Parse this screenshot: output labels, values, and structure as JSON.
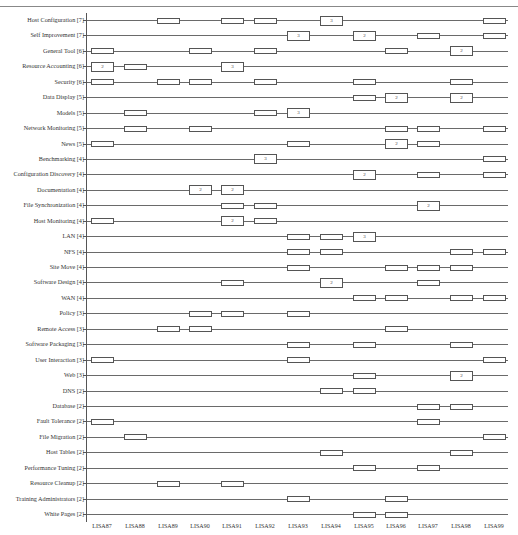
{
  "chart_data": {
    "type": "timeline-presence",
    "title": "",
    "xlabel": "",
    "ylabel": "",
    "categories": [
      "LISA87",
      "LISA88",
      "LISA89",
      "LISA90",
      "LISA91",
      "LISA92",
      "LISA93",
      "LISA94",
      "LISA95",
      "LISA96",
      "LISA97",
      "LISA98",
      "LISA99"
    ],
    "legend_note": "box = paper(s) on topic at that conference; number inside = count when >1",
    "rows": [
      {
        "label": "Host Configuration [7]",
        "marks": [
          {
            "x": "LISA89",
            "n": 1
          },
          {
            "x": "LISA91",
            "n": 1
          },
          {
            "x": "LISA92",
            "n": 1
          },
          {
            "x": "LISA94",
            "n": 3
          },
          {
            "x": "LISA99",
            "n": 1
          }
        ]
      },
      {
        "label": "Self Improvement [7]",
        "marks": [
          {
            "x": "LISA93",
            "n": 3
          },
          {
            "x": "LISA95",
            "n": 2
          },
          {
            "x": "LISA97",
            "n": 1
          },
          {
            "x": "LISA99",
            "n": 1
          }
        ]
      },
      {
        "label": "General Tool [6]",
        "marks": [
          {
            "x": "LISA87",
            "n": 1
          },
          {
            "x": "LISA90",
            "n": 1
          },
          {
            "x": "LISA92",
            "n": 1
          },
          {
            "x": "LISA96",
            "n": 1
          },
          {
            "x": "LISA98",
            "n": 2
          }
        ]
      },
      {
        "label": "Resource Accounting [6]",
        "marks": [
          {
            "x": "LISA87",
            "n": 2
          },
          {
            "x": "LISA88",
            "n": 1
          },
          {
            "x": "LISA91",
            "n": 3
          }
        ]
      },
      {
        "label": "Security [6]",
        "marks": [
          {
            "x": "LISA87",
            "n": 1
          },
          {
            "x": "LISA89",
            "n": 1
          },
          {
            "x": "LISA90",
            "n": 1
          },
          {
            "x": "LISA92",
            "n": 1
          },
          {
            "x": "LISA95",
            "n": 1
          },
          {
            "x": "LISA98",
            "n": 1
          }
        ]
      },
      {
        "label": "Data Display [5]",
        "marks": [
          {
            "x": "LISA95",
            "n": 1
          },
          {
            "x": "LISA96",
            "n": 2
          },
          {
            "x": "LISA98",
            "n": 2
          }
        ]
      },
      {
        "label": "Models [5]",
        "marks": [
          {
            "x": "LISA88",
            "n": 1
          },
          {
            "x": "LISA92",
            "n": 1
          },
          {
            "x": "LISA93",
            "n": 3
          }
        ]
      },
      {
        "label": "Network Monitoring [5]",
        "marks": [
          {
            "x": "LISA88",
            "n": 1
          },
          {
            "x": "LISA90",
            "n": 1
          },
          {
            "x": "LISA96",
            "n": 1
          },
          {
            "x": "LISA97",
            "n": 1
          },
          {
            "x": "LISA99",
            "n": 1
          }
        ]
      },
      {
        "label": "News [5]",
        "marks": [
          {
            "x": "LISA87",
            "n": 1
          },
          {
            "x": "LISA93",
            "n": 1
          },
          {
            "x": "LISA96",
            "n": 2
          },
          {
            "x": "LISA97",
            "n": 1
          }
        ]
      },
      {
        "label": "Benchmarking [4]",
        "marks": [
          {
            "x": "LISA92",
            "n": 3
          },
          {
            "x": "LISA99",
            "n": 1
          }
        ]
      },
      {
        "label": "Configuration Discovery [4]",
        "marks": [
          {
            "x": "LISA95",
            "n": 2
          },
          {
            "x": "LISA97",
            "n": 1
          },
          {
            "x": "LISA99",
            "n": 1
          }
        ]
      },
      {
        "label": "Documentation [4]",
        "marks": [
          {
            "x": "LISA90",
            "n": 2
          },
          {
            "x": "LISA91",
            "n": 2
          }
        ]
      },
      {
        "label": "File Synchronization [4]",
        "marks": [
          {
            "x": "LISA91",
            "n": 1
          },
          {
            "x": "LISA92",
            "n": 1
          },
          {
            "x": "LISA97",
            "n": 2
          }
        ]
      },
      {
        "label": "Host Monitoring [4]",
        "marks": [
          {
            "x": "LISA87",
            "n": 1
          },
          {
            "x": "LISA91",
            "n": 2
          },
          {
            "x": "LISA92",
            "n": 1
          }
        ]
      },
      {
        "label": "LAN [4]",
        "marks": [
          {
            "x": "LISA93",
            "n": 1
          },
          {
            "x": "LISA94",
            "n": 1
          },
          {
            "x": "LISA95",
            "n": 3
          }
        ]
      },
      {
        "label": "NFS [4]",
        "marks": [
          {
            "x": "LISA93",
            "n": 1
          },
          {
            "x": "LISA94",
            "n": 1
          },
          {
            "x": "LISA98",
            "n": 1
          },
          {
            "x": "LISA99",
            "n": 1
          }
        ]
      },
      {
        "label": "Site Move [4]",
        "marks": [
          {
            "x": "LISA93",
            "n": 1
          },
          {
            "x": "LISA96",
            "n": 1
          },
          {
            "x": "LISA97",
            "n": 1
          },
          {
            "x": "LISA98",
            "n": 1
          }
        ]
      },
      {
        "label": "Software Design [4]",
        "marks": [
          {
            "x": "LISA91",
            "n": 1
          },
          {
            "x": "LISA94",
            "n": 2
          },
          {
            "x": "LISA97",
            "n": 1
          }
        ]
      },
      {
        "label": "WAN [4]",
        "marks": [
          {
            "x": "LISA95",
            "n": 1
          },
          {
            "x": "LISA96",
            "n": 1
          },
          {
            "x": "LISA98",
            "n": 1
          },
          {
            "x": "LISA99",
            "n": 1
          }
        ]
      },
      {
        "label": "Policy [3]",
        "marks": [
          {
            "x": "LISA90",
            "n": 1
          },
          {
            "x": "LISA91",
            "n": 1
          },
          {
            "x": "LISA93",
            "n": 1
          }
        ]
      },
      {
        "label": "Remote Access [3]",
        "marks": [
          {
            "x": "LISA89",
            "n": 1
          },
          {
            "x": "LISA90",
            "n": 1
          },
          {
            "x": "LISA96",
            "n": 1
          }
        ]
      },
      {
        "label": "Software Packaging [3]",
        "marks": [
          {
            "x": "LISA93",
            "n": 1
          },
          {
            "x": "LISA95",
            "n": 1
          },
          {
            "x": "LISA98",
            "n": 1
          }
        ]
      },
      {
        "label": "User Interaction [3]",
        "marks": [
          {
            "x": "LISA87",
            "n": 1
          },
          {
            "x": "LISA93",
            "n": 1
          },
          {
            "x": "LISA99",
            "n": 1
          }
        ]
      },
      {
        "label": "Web [3]",
        "marks": [
          {
            "x": "LISA95",
            "n": 1
          },
          {
            "x": "LISA98",
            "n": 2
          }
        ]
      },
      {
        "label": "DNS [2]",
        "marks": [
          {
            "x": "LISA94",
            "n": 1
          },
          {
            "x": "LISA95",
            "n": 1
          }
        ]
      },
      {
        "label": "Database [2]",
        "marks": [
          {
            "x": "LISA97",
            "n": 1
          },
          {
            "x": "LISA98",
            "n": 1
          }
        ]
      },
      {
        "label": "Fault Tolerance [2]",
        "marks": [
          {
            "x": "LISA87",
            "n": 1
          },
          {
            "x": "LISA97",
            "n": 1
          }
        ]
      },
      {
        "label": "File Migration [2]",
        "marks": [
          {
            "x": "LISA88",
            "n": 1
          },
          {
            "x": "LISA99",
            "n": 1
          }
        ]
      },
      {
        "label": "Host Tables [2]",
        "marks": [
          {
            "x": "LISA94",
            "n": 1
          },
          {
            "x": "LISA98",
            "n": 1
          }
        ]
      },
      {
        "label": "Performance Tuning [2]",
        "marks": [
          {
            "x": "LISA95",
            "n": 1
          },
          {
            "x": "LISA97",
            "n": 1
          }
        ]
      },
      {
        "label": "Resource Cleanup [2]",
        "marks": [
          {
            "x": "LISA89",
            "n": 1
          },
          {
            "x": "LISA91",
            "n": 1
          }
        ]
      },
      {
        "label": "Training Administrators [2]",
        "marks": [
          {
            "x": "LISA93",
            "n": 1
          },
          {
            "x": "LISA96",
            "n": 1
          }
        ]
      },
      {
        "label": "White Pages [2]",
        "marks": [
          {
            "x": "LISA95",
            "n": 1
          },
          {
            "x": "LISA96",
            "n": 1
          }
        ]
      }
    ]
  },
  "layout": {
    "x_centers": [
      102,
      135,
      168,
      200,
      232,
      265,
      298,
      331,
      364,
      396,
      428,
      461,
      494
    ],
    "row_top": 14,
    "row_step": 15.44
  }
}
